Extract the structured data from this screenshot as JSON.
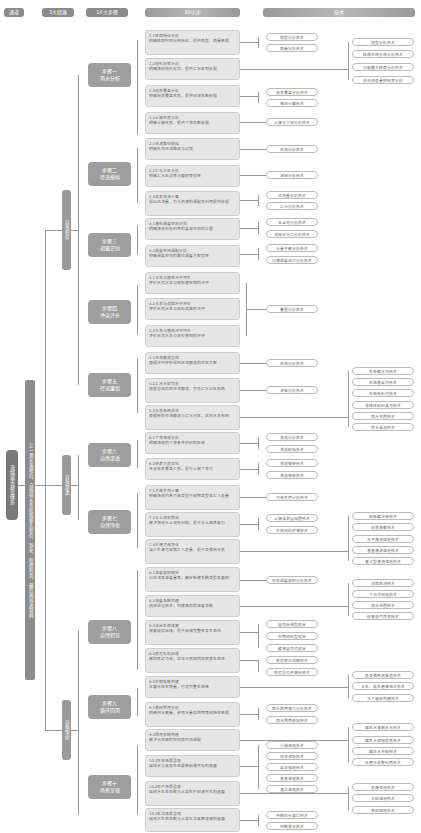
{
  "headers": [
    {
      "label": "通道"
    },
    {
      "label": "3大措施"
    },
    {
      "label": "10大步骤"
    },
    {
      "label": "30小步"
    },
    {
      "label": "技术"
    }
  ],
  "root": {
    "label": "海绵城市建设体系"
  },
  "channel": {
    "label": "让一滴水落地后，自然排水系统能够先积存、净化、积攒利用，最后再排进管网"
  },
  "measures": [
    {
      "label": "自然积存"
    },
    {
      "label": "自然渗透"
    },
    {
      "label": "自然净化"
    }
  ],
  "steps": [
    {
      "line1": "步骤一",
      "line2": "雨水分析"
    },
    {
      "line1": "步骤二",
      "line2": "径流模拟"
    },
    {
      "line1": "步骤三",
      "line2": "调蓄识别"
    },
    {
      "line1": "步骤四",
      "line2": "冲突评价"
    },
    {
      "line1": "步骤五",
      "line2": "径流重组"
    },
    {
      "line1": "步骤六",
      "line2": "自然渗透"
    },
    {
      "line1": "步骤七",
      "line2": "自然净化"
    },
    {
      "line1": "步骤八",
      "line2": "自然积存"
    },
    {
      "line1": "步骤九",
      "line2": "循环回用"
    },
    {
      "line1": "步骤十",
      "line2": "场景呈现"
    }
  ],
  "substeps": [
    {
      "title": "1.1降雨特征分析",
      "desc": "明确降雨时空分布特征，提供雨型、雨量数据"
    },
    {
      "title": "1.2地形地貌分析",
      "desc": "明确场地地形走势，提供汇水区划依据"
    },
    {
      "title": "1.3地表覆盖分析",
      "desc": "明确地表覆盖性质，提供径流系数依据"
    },
    {
      "title": "1.4土壤性质分析",
      "desc": "明确土壤性质，提供下渗系数依据"
    },
    {
      "title": "2.1径流路径模拟",
      "desc": "明确天然径流路径与过程"
    },
    {
      "title": "2.2汇水分区分析",
      "desc": "明确汇水区边界与面积等信息"
    },
    {
      "title": "2.3地表径流计算",
      "desc": "得出径流量，为水资源的调配及利用提供依据"
    },
    {
      "title": "3.1潜在调蓄空间识别",
      "desc": "明确场地有效利用的蓄滞空间的位置"
    },
    {
      "title": "3.2调蓄空间调配分析",
      "desc": "明确调蓄空间的最优调蓄方案信息"
    },
    {
      "title": "4.1水系与建筑冲突评价",
      "desc": "评价天然水系与现有建筑物的冲突"
    },
    {
      "title": "4.2水系与道路冲突评价",
      "desc": "评价天然水系与现有道路的冲突"
    },
    {
      "title": "4.3水系与管网冲突评价",
      "desc": "评价天然水系与现有管网的冲突"
    },
    {
      "title": "5.1径流廊道重组",
      "desc": "根据冲突评价得到径流廊道的优化方案"
    },
    {
      "title": "5.2汇水分区完善",
      "desc": "根据重组后的径流廊道，完善汇水分区布局"
    },
    {
      "title": "5.3水系布局优化",
      "desc": "根据新的径流廊道与汇水分区，优化水系布局"
    },
    {
      "title": "6.1下渗场地分析",
      "desc": "明确场地内下渗条件较好的区域"
    },
    {
      "title": "6.2地表介质优化",
      "desc": "改善地表覆盖介质，提升土壤下渗力"
    },
    {
      "title": "7.1污染负荷计算",
      "desc": "明确场地内各污染类型污染物类型及汇入总量"
    },
    {
      "title": "7.2水土流失防治",
      "desc": "解决场地水土流失问题，提升水土涵养能力"
    },
    {
      "title": "7.3外源污染净化",
      "desc": "减少外源污染物汇入总量，提升及保持水质"
    },
    {
      "title": "8.1滞蓄容积核定",
      "desc": "以径流及滞蓄量等，确定新建系统类型及面积"
    },
    {
      "title": "8.2滞蓄系统构建",
      "desc": "选择适当技术，构建高效的滞蓄系统"
    },
    {
      "title": "8.3滨岸生态修复",
      "desc": "修复破损岸线，提升岸线完整性及生态性"
    },
    {
      "title": "8.4底泥有机治理",
      "desc": "解除底泥污染，优化水底结构及底质生态性"
    },
    {
      "title": "8.5生物系统构建",
      "desc": "丰富水体生物量，打造完整生态链"
    },
    {
      "title": "9.1循环回用分析",
      "desc": "明确供水需量，获用水量及回用等级弹性数据"
    },
    {
      "title": "9.2回用系统构建",
      "desc": "解决水资源的空间及时间调配"
    },
    {
      "title": "10.1生态场景呈现",
      "desc": "展现水与其他生态要素和谐共存的画面"
    },
    {
      "title": "10.2生产场景呈现",
      "desc": "展现水生态系统与人类生产和谐共生的画面"
    },
    {
      "title": "10.3生活场景呈现",
      "desc": "展现水生态系统与人类生活紧密连接的画面"
    }
  ],
  "techs_left": [
    "雨型分析技术",
    "雨量分析技术",
    "地表覆盖分析技术",
    "坡向计算技术",
    "土壤水文组分析技术",
    "径流分析技术",
    "流域分析技术",
    "径流量分析技术",
    "汇水分析技术",
    "低洼地分析技术",
    "流域出水口分析技术",
    "水量平衡分析技术",
    "坑塘调蓄迭代分析技术",
    "叠置分析技术",
    "径流分析技术",
    "流域分析技术",
    "渗透分析技术",
    "渗透模拟技术",
    "渗透铺装技术",
    "渗透铺装技术",
    "污染负荷分析技术",
    "土壤浅表层加固技术",
    "生态材料护坡技术",
    "有效调蓄容积分析技术",
    "自然岸线型驳岸",
    "生物材料型驳岸",
    "缓坡自然式驳岸",
    "底泥原位消解技术",
    "底泥异位资源化技术",
    "雨水回用潜力分析技术",
    "雨水回用模拟技术",
    "小微湿地技术",
    "林泽湿地技术",
    "草泽湿地技术",
    "垂直湿地技术",
    "混合湿地技术",
    "传统码头渡口技术",
    "传统排水技术"
  ],
  "techs_right": [
    "雨型分析技术",
    "降雨空间分布分析技术",
    "可能最大降雨分析技术",
    "年径流总量控制率分析",
    "生态截水沟技术",
    "生态植草沟技术",
    "生态砾石沟技术",
    "渗排性碎石溪沟技术",
    "雨水花园技术",
    "跌水溪流技术",
    "模板缓冲带技术",
    "前置塘截技术",
    "水平潜流湿地技术",
    "垂直潜流湿地技术",
    "复合型潜流湿地技术",
    "初雨弃流技术",
    "下沉式绿地技术",
    "雨水花园技术",
    "砂基透气防渗技术",
    "鱼类栖息地营造技术",
    "水生、挺生植被组合技术",
    "水下森林构建技术",
    "再生水灌溉补水技术",
    "再生水湿地提质技术",
    "再生水冲厕技术",
    "无梗水收集利用技术",
    "鱼塘湿地技术",
    "水田湿地技术",
    "桑田湿地技术"
  ],
  "colors": {
    "header": "#8a8a8a",
    "step": "#9e9e9e",
    "substep": "#e6e6e6",
    "line": "#9a9a9a",
    "root": "#7a7a7a"
  }
}
